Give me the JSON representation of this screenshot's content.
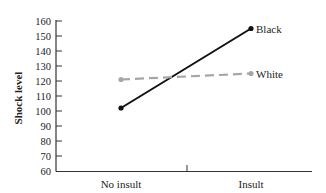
{
  "chart_data": {
    "type": "line",
    "title": "",
    "xlabel": "",
    "ylabel": "Shock level",
    "categories": [
      "No insult",
      "Insult"
    ],
    "series": [
      {
        "name": "Black",
        "values": [
          102,
          155
        ],
        "color": "#111111",
        "style": "solid"
      },
      {
        "name": "White",
        "values": [
          121,
          125
        ],
        "color": "#a6a6a6",
        "style": "dashed"
      }
    ],
    "ylim": [
      60,
      160
    ],
    "yticks": [
      60,
      70,
      80,
      90,
      100,
      110,
      120,
      130,
      140,
      150,
      160
    ],
    "grid": false,
    "legend": "direct labels at line ends"
  }
}
